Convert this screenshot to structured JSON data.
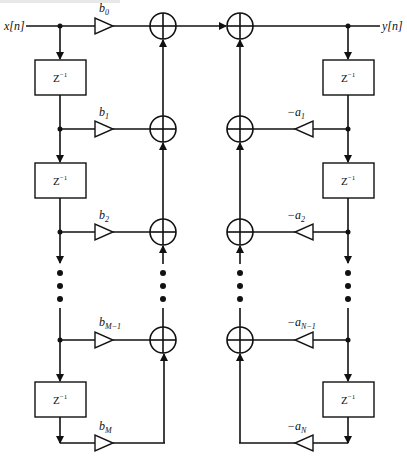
{
  "diagram": {
    "input_label": "x[n]",
    "output_label": "y[n]",
    "delay_label": "Z",
    "delay_exponent": "−1",
    "feedforward_gains": [
      {
        "base": "b",
        "sub": "0"
      },
      {
        "base": "b",
        "sub": "1"
      },
      {
        "base": "b",
        "sub": "2"
      },
      {
        "base": "b",
        "sub": "M−1"
      },
      {
        "base": "b",
        "sub": "M"
      }
    ],
    "feedback_gains": [
      {
        "base": "−a",
        "sub": "1"
      },
      {
        "base": "−a",
        "sub": "2"
      },
      {
        "base": "−a",
        "sub": "N−1"
      },
      {
        "base": "−a",
        "sub": "N"
      }
    ],
    "left_delay_count": 3,
    "right_delay_count": 3,
    "colors": {
      "line": "#111111",
      "background": "#ffffff"
    }
  }
}
